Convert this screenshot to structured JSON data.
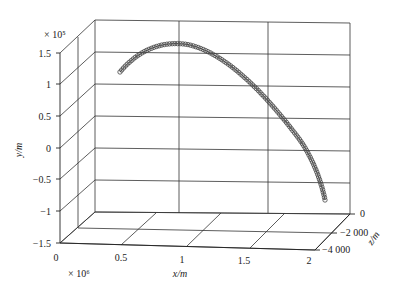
{
  "chart_data": {
    "type": "line",
    "projection": "3d",
    "title": "",
    "xlabel": "x/m",
    "ylabel": "y/m",
    "zlabel": "z/m",
    "x_multiplier": "× 10⁶",
    "y_multiplier": "× 10⁵",
    "x_ticks": [
      "0",
      "0.5",
      "1",
      "1.5",
      "2"
    ],
    "y_ticks": [
      "1.5",
      "1",
      "0.5",
      "0",
      "−0.5",
      "−1",
      "−1.5"
    ],
    "z_ticks": [
      "0",
      "−2 000",
      "−4 000"
    ],
    "xlim": [
      0,
      2.2
    ],
    "ylim": [
      -1.5,
      1.5
    ],
    "zlim": [
      -5000,
      0
    ],
    "grid": true,
    "legend": null,
    "series": [
      {
        "name": "trajectory",
        "marker": "circle",
        "x": [
          0.25,
          0.4,
          0.55,
          0.7,
          0.85,
          1.0,
          1.15,
          1.3,
          1.45,
          1.6,
          1.75,
          1.9,
          2.05,
          2.2
        ],
        "y": [
          1.15,
          1.38,
          1.5,
          1.52,
          1.45,
          1.28,
          1.02,
          0.7,
          0.3,
          -0.1,
          -0.45,
          -0.75,
          -1.0,
          -1.15
        ],
        "z": [
          0,
          0,
          0,
          0,
          0,
          0,
          0,
          0,
          0,
          0,
          0,
          0,
          0,
          0
        ]
      }
    ]
  }
}
